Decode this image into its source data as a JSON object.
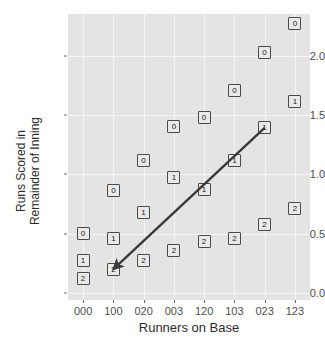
{
  "chart_data": {
    "type": "scatter",
    "title": "",
    "xlabel": "Runners on Base",
    "ylabel": "Runs Scored in\nRemainder of Inning",
    "ylabel_line1": "Runs Scored in",
    "ylabel_line2": "Remainder of Inning",
    "categories": [
      "000",
      "100",
      "020",
      "003",
      "120",
      "103",
      "023",
      "123"
    ],
    "x_tick_labels": [
      "000",
      "100",
      "020",
      "003",
      "120",
      "103",
      "023",
      "123"
    ],
    "y_tick_labels": [
      "0.0",
      "0.5",
      "1.0",
      "1.5",
      "2.0"
    ],
    "y_tick_values": [
      0.0,
      0.5,
      1.0,
      1.5,
      2.0
    ],
    "ylim": [
      -0.06,
      2.35
    ],
    "grid": true,
    "legend": null,
    "point_label_meaning": "number of outs",
    "series": [
      {
        "name": "0",
        "point_label": "0",
        "values": [
          0.5,
          0.86,
          1.12,
          1.4,
          1.48,
          1.71,
          2.03,
          2.27
        ]
      },
      {
        "name": "1",
        "point_label": "1",
        "values": [
          0.27,
          0.46,
          0.68,
          0.97,
          0.87,
          1.12,
          1.39,
          1.61
        ]
      },
      {
        "name": "2",
        "point_label": "2",
        "values": [
          0.12,
          0.2,
          0.27,
          0.36,
          0.43,
          0.46,
          0.58,
          0.71
        ]
      }
    ],
    "annotations": [
      {
        "type": "arrow",
        "from_category": "023",
        "from_value": 1.39,
        "to_category": "100",
        "to_value": 0.2,
        "color": "#3a3a3a"
      }
    ],
    "colors": {
      "panel_background": "#e4e4e4",
      "gridline": "#f6f6f6",
      "point_fill": "#e9e9e9",
      "point_border": "#4a4a4a",
      "text": "#2b2b2b",
      "tick_text": "#4d4d4d",
      "arrow": "#3a3a3a"
    }
  }
}
